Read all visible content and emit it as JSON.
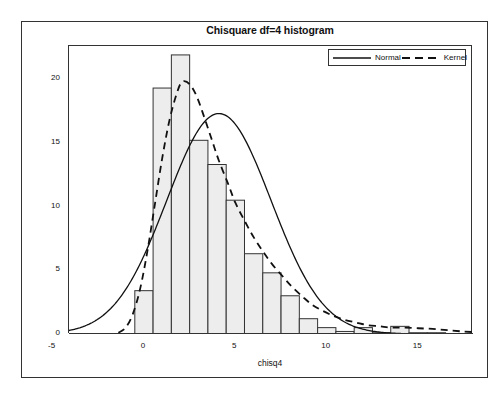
{
  "chart_data": {
    "type": "bar",
    "title": "Chisquare df=4 histogram",
    "xlabel": "chisq4",
    "ylabel": "Percent",
    "xlim": [
      -4.1,
      18.0
    ],
    "ylim": [
      0,
      22.6
    ],
    "xticks": [
      -5,
      0,
      5,
      10,
      15
    ],
    "xtick_labels": [
      "-5",
      "0",
      "5",
      "10",
      "15"
    ],
    "yticks": [
      0,
      5,
      10,
      15,
      20
    ],
    "ytick_labels": [
      "0",
      "5",
      "10",
      "15",
      "20"
    ],
    "grid": false,
    "bin_width": 1,
    "bin_centers": [
      0,
      1,
      2,
      3,
      4,
      5,
      6,
      7,
      8,
      9,
      10,
      11,
      12,
      13,
      14,
      15,
      16
    ],
    "values": [
      3.4,
      19.3,
      21.9,
      15.2,
      13.3,
      10.5,
      6.3,
      4.8,
      3.0,
      1.2,
      0.5,
      0.2,
      0.5,
      0.1,
      0.6,
      0.1,
      0.1
    ],
    "bar_fill": "#ededed",
    "bar_edge": "#333333",
    "series": [
      {
        "name": "Normal",
        "style": "solid",
        "color": "#111111",
        "mean": 4.1,
        "sd": 2.85,
        "peak_value": 17.3,
        "scale": 100
      },
      {
        "name": "Kernel",
        "style": "dashed",
        "color": "#111111",
        "peak_x": 2.1,
        "peak_value": 19.8,
        "x": [
          -1.4,
          -1.0,
          -0.6,
          -0.2,
          0.2,
          0.6,
          1.0,
          1.4,
          1.8,
          2.1,
          2.5,
          2.9,
          3.3,
          3.7,
          4.1,
          4.6,
          5.0,
          5.5,
          6.0,
          6.5,
          7.0,
          7.6,
          8.1,
          8.7,
          9.2,
          9.8,
          10.4,
          11.0,
          11.6,
          12.2,
          12.9,
          13.5,
          14.2,
          15.0,
          15.8,
          16.6,
          17.4,
          18.0
        ],
        "y": [
          0.1,
          0.5,
          1.6,
          3.6,
          6.6,
          10.2,
          13.8,
          16.8,
          18.9,
          19.8,
          19.6,
          18.6,
          17.0,
          15.3,
          13.6,
          11.8,
          10.3,
          8.9,
          7.6,
          6.5,
          5.5,
          4.5,
          3.7,
          2.9,
          2.3,
          1.8,
          1.4,
          1.1,
          0.9,
          0.7,
          0.6,
          0.5,
          0.5,
          0.45,
          0.4,
          0.3,
          0.2,
          0.15
        ]
      }
    ]
  },
  "legend": {
    "position": "top-right",
    "entries": [
      {
        "label": "Normal",
        "style": "solid"
      },
      {
        "label": "Kernel",
        "style": "dashed"
      }
    ]
  }
}
